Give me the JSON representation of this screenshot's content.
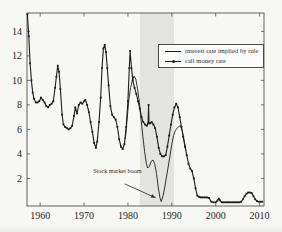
{
  "figure": {
    "background": "#f7f7f4",
    "frame_color": "#3c3c3c",
    "label_color": "#1f1f1f"
  },
  "legend": {
    "position": "upper right",
    "items": [
      {
        "sample": "solid-line",
        "label": "interest rate implied by rule"
      },
      {
        "sample": "marker-line",
        "label": "call money rate"
      }
    ]
  },
  "chart_data": {
    "type": "line",
    "title": "",
    "xlabel": "",
    "ylabel": "",
    "xlim": [
      1957,
      2011
    ],
    "ylim": [
      -0.25,
      15.5
    ],
    "x_ticks": [
      1960,
      1970,
      1980,
      1990,
      2000,
      2010
    ],
    "y_ticks": [
      2,
      4,
      6,
      8,
      10,
      12,
      14
    ],
    "grid": false,
    "line_color": "#1c1c1c",
    "shaded_region": {
      "x_start": 1982.7,
      "x_end": 1990.5,
      "color": "#e3e3e0",
      "meaning": "stock market boom period"
    },
    "annotation": {
      "text": "Stock market boom",
      "text_x": 1977.6,
      "text_y": 2.45,
      "arrow_from_x": 1979.3,
      "arrow_from_y": 1.55,
      "arrow_to_x": 1986.3,
      "arrow_to_y": 0.42
    },
    "series": [
      {
        "name": "interest rate implied by rule",
        "style": "solid",
        "marker": "none",
        "points": [
          [
            1979.4,
            5.2
          ],
          [
            1979.8,
            6.8
          ],
          [
            1980.2,
            8.4
          ],
          [
            1980.6,
            9.4
          ],
          [
            1981.0,
            10.0
          ],
          [
            1981.4,
            10.35
          ],
          [
            1981.8,
            10.1
          ],
          [
            1982.2,
            9.3
          ],
          [
            1982.6,
            8.2
          ],
          [
            1983.0,
            6.8
          ],
          [
            1983.4,
            5.4
          ],
          [
            1983.8,
            4.2
          ],
          [
            1984.2,
            3.2
          ],
          [
            1984.5,
            2.85
          ],
          [
            1984.9,
            3.0
          ],
          [
            1985.3,
            3.4
          ],
          [
            1985.7,
            3.5
          ],
          [
            1986.1,
            3.2
          ],
          [
            1986.5,
            2.4
          ],
          [
            1986.9,
            1.3
          ],
          [
            1987.3,
            0.4
          ],
          [
            1987.6,
            0.1
          ],
          [
            1988.0,
            0.6
          ],
          [
            1988.4,
            1.3
          ],
          [
            1988.8,
            2.2
          ],
          [
            1989.2,
            3.0
          ],
          [
            1989.6,
            3.9
          ],
          [
            1990.0,
            4.8
          ],
          [
            1990.4,
            5.5
          ],
          [
            1990.8,
            5.9
          ],
          [
            1991.2,
            6.1
          ],
          [
            1991.6,
            6.25
          ],
          [
            1992.0,
            6.3
          ],
          [
            1992.4,
            5.85
          ],
          [
            1992.8,
            5.1
          ],
          [
            1993.2,
            4.3
          ]
        ]
      },
      {
        "name": "call money rate",
        "style": "solid",
        "marker": "square",
        "points": [
          [
            1957.1,
            15.4
          ],
          [
            1957.4,
            13.6
          ],
          [
            1957.7,
            11.4
          ],
          [
            1958.0,
            10.0
          ],
          [
            1958.3,
            9.0
          ],
          [
            1958.6,
            8.5
          ],
          [
            1959.0,
            8.2
          ],
          [
            1959.4,
            8.2
          ],
          [
            1959.8,
            8.3
          ],
          [
            1960.2,
            8.6
          ],
          [
            1960.6,
            8.4
          ],
          [
            1961.0,
            8.2
          ],
          [
            1961.4,
            7.9
          ],
          [
            1961.8,
            7.8
          ],
          [
            1962.2,
            8.0
          ],
          [
            1962.6,
            8.1
          ],
          [
            1963.0,
            8.3
          ],
          [
            1963.4,
            9.4
          ],
          [
            1963.7,
            10.3
          ],
          [
            1964.0,
            11.2
          ],
          [
            1964.3,
            10.7
          ],
          [
            1964.6,
            9.3
          ],
          [
            1965.0,
            7.2
          ],
          [
            1965.3,
            6.4
          ],
          [
            1965.7,
            6.2
          ],
          [
            1966.1,
            6.1
          ],
          [
            1966.5,
            6.0
          ],
          [
            1966.9,
            6.1
          ],
          [
            1967.3,
            6.3
          ],
          [
            1967.7,
            7.1
          ],
          [
            1968.0,
            7.8
          ],
          [
            1968.4,
            7.3
          ],
          [
            1968.8,
            8.0
          ],
          [
            1969.2,
            8.2
          ],
          [
            1969.6,
            8.1
          ],
          [
            1970.0,
            8.3
          ],
          [
            1970.3,
            8.4
          ],
          [
            1970.7,
            8.0
          ],
          [
            1971.1,
            7.4
          ],
          [
            1971.5,
            6.6
          ],
          [
            1971.9,
            5.8
          ],
          [
            1972.3,
            4.9
          ],
          [
            1972.7,
            4.5
          ],
          [
            1973.0,
            5.0
          ],
          [
            1973.4,
            6.6
          ],
          [
            1973.8,
            8.6
          ],
          [
            1974.1,
            11.0
          ],
          [
            1974.4,
            12.6
          ],
          [
            1974.7,
            12.9
          ],
          [
            1975.0,
            12.3
          ],
          [
            1975.3,
            11.0
          ],
          [
            1975.6,
            9.6
          ],
          [
            1976.0,
            7.9
          ],
          [
            1976.4,
            7.2
          ],
          [
            1976.8,
            7.0
          ],
          [
            1977.2,
            6.8
          ],
          [
            1977.6,
            6.2
          ],
          [
            1978.0,
            5.2
          ],
          [
            1978.4,
            4.6
          ],
          [
            1978.8,
            4.4
          ],
          [
            1979.2,
            4.8
          ],
          [
            1979.6,
            6.2
          ],
          [
            1980.0,
            8.3
          ],
          [
            1980.3,
            11.0
          ],
          [
            1980.5,
            12.4
          ],
          [
            1980.8,
            11.0
          ],
          [
            1981.1,
            10.0
          ],
          [
            1981.5,
            9.4
          ],
          [
            1981.9,
            8.9
          ],
          [
            1982.3,
            8.3
          ],
          [
            1982.7,
            7.7
          ],
          [
            1983.1,
            7.0
          ],
          [
            1983.5,
            6.6
          ],
          [
            1983.9,
            6.4
          ],
          [
            1984.3,
            6.3
          ],
          [
            1984.6,
            6.5
          ],
          [
            1984.7,
            8.0
          ],
          [
            1984.8,
            6.5
          ],
          [
            1985.1,
            6.5
          ],
          [
            1985.4,
            6.6
          ],
          [
            1985.8,
            6.4
          ],
          [
            1986.2,
            6.1
          ],
          [
            1986.6,
            5.4
          ],
          [
            1987.0,
            4.5
          ],
          [
            1987.4,
            4.0
          ],
          [
            1987.8,
            3.8
          ],
          [
            1988.2,
            3.8
          ],
          [
            1988.6,
            3.9
          ],
          [
            1989.0,
            4.6
          ],
          [
            1989.4,
            5.5
          ],
          [
            1989.8,
            6.4
          ],
          [
            1990.2,
            7.2
          ],
          [
            1990.6,
            7.8
          ],
          [
            1991.0,
            8.1
          ],
          [
            1991.4,
            7.8
          ],
          [
            1991.8,
            7.0
          ],
          [
            1992.2,
            6.2
          ],
          [
            1992.6,
            5.4
          ],
          [
            1993.0,
            4.6
          ],
          [
            1993.4,
            3.9
          ],
          [
            1993.8,
            3.2
          ],
          [
            1994.2,
            2.8
          ],
          [
            1994.6,
            2.6
          ],
          [
            1995.0,
            2.0
          ],
          [
            1995.4,
            1.2
          ],
          [
            1995.8,
            0.6
          ],
          [
            1996.2,
            0.5
          ],
          [
            1996.6,
            0.45
          ],
          [
            1997.0,
            0.45
          ],
          [
            1997.5,
            0.45
          ],
          [
            1998.0,
            0.45
          ],
          [
            1998.5,
            0.4
          ],
          [
            1999.0,
            0.1
          ],
          [
            1999.5,
            0.05
          ],
          [
            2000.0,
            0.05
          ],
          [
            2000.4,
            0.2
          ],
          [
            2000.7,
            0.35
          ],
          [
            2001.0,
            0.2
          ],
          [
            2001.4,
            0.05
          ],
          [
            2001.8,
            0.05
          ],
          [
            2002.2,
            0.05
          ],
          [
            2002.6,
            0.05
          ],
          [
            2003.0,
            0.05
          ],
          [
            2003.4,
            0.05
          ],
          [
            2003.8,
            0.05
          ],
          [
            2004.2,
            0.05
          ],
          [
            2004.6,
            0.05
          ],
          [
            2005.0,
            0.05
          ],
          [
            2005.4,
            0.05
          ],
          [
            2005.8,
            0.1
          ],
          [
            2006.2,
            0.3
          ],
          [
            2006.6,
            0.55
          ],
          [
            2007.0,
            0.75
          ],
          [
            2007.4,
            0.85
          ],
          [
            2007.8,
            0.85
          ],
          [
            2008.2,
            0.8
          ],
          [
            2008.6,
            0.55
          ],
          [
            2009.0,
            0.3
          ],
          [
            2009.4,
            0.15
          ],
          [
            2009.8,
            0.1
          ],
          [
            2010.2,
            0.1
          ],
          [
            2010.6,
            0.1
          ]
        ]
      }
    ]
  }
}
